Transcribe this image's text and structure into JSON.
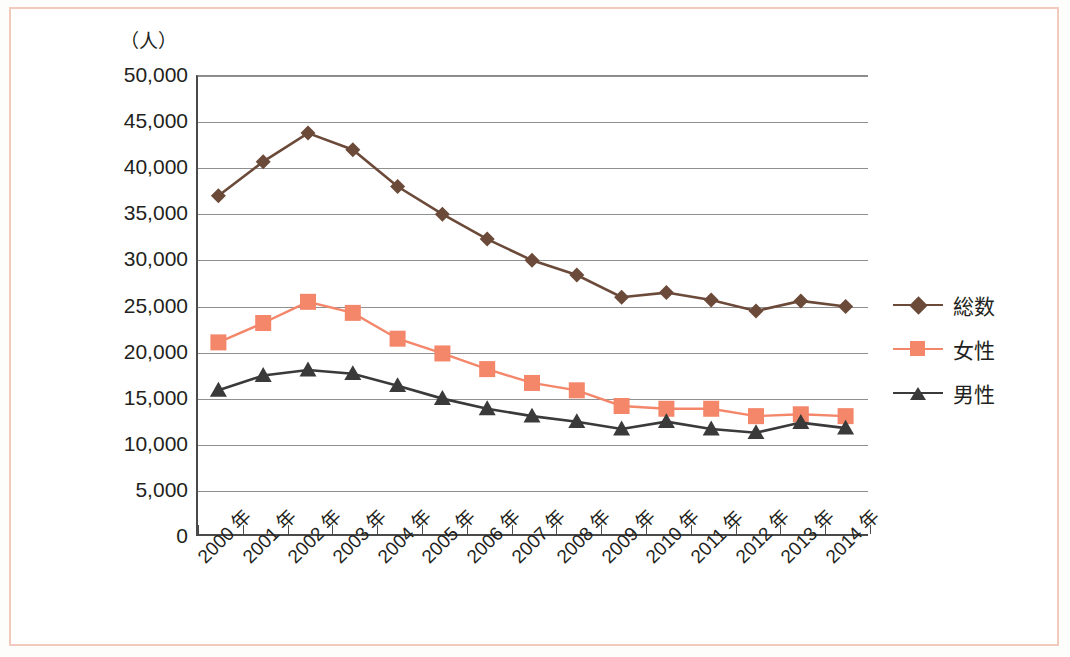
{
  "figure": {
    "unit_label": "（人）",
    "border_color": "#f2c9bd",
    "background": "#ffffff"
  },
  "legend": {
    "position": "right",
    "items": [
      {
        "label": "総数",
        "color": "#6b4a3a",
        "marker": "diamond"
      },
      {
        "label": "女性",
        "color": "#f4866a",
        "marker": "square"
      },
      {
        "label": "男性",
        "color": "#3a3a3a",
        "marker": "triangle"
      }
    ]
  },
  "chart_data": {
    "type": "line",
    "title": "",
    "xlabel": "",
    "ylabel": "（人）",
    "ylim": [
      0,
      50000
    ],
    "ytick_values": [
      0,
      5000,
      10000,
      15000,
      20000,
      25000,
      30000,
      35000,
      40000,
      45000,
      50000
    ],
    "ytick_labels": [
      "0",
      "5,000",
      "10,000",
      "15,000",
      "20,000",
      "25,000",
      "30,000",
      "35,000",
      "40,000",
      "45,000",
      "50,000"
    ],
    "grid": true,
    "categories": [
      "2000 年",
      "2001 年",
      "2002 年",
      "2003 年",
      "2004 年",
      "2005 年",
      "2006 年",
      "2007 年",
      "2008 年",
      "2009 年",
      "2010 年",
      "2011 年",
      "2012 年",
      "2013 年",
      "2014 年"
    ],
    "x": [
      2000,
      2001,
      2002,
      2003,
      2004,
      2005,
      2006,
      2007,
      2008,
      2009,
      2010,
      2011,
      2012,
      2013,
      2014
    ],
    "series": [
      {
        "name": "総数",
        "color": "#6b4a3a",
        "marker": "diamond",
        "values": [
          36900,
          40600,
          43700,
          41900,
          37900,
          34900,
          32200,
          29900,
          28300,
          25900,
          26400,
          25600,
          24400,
          25500,
          24900
        ]
      },
      {
        "name": "女性",
        "color": "#f4866a",
        "marker": "square",
        "values": [
          21000,
          23100,
          25400,
          24200,
          21400,
          19800,
          18100,
          16600,
          15800,
          14100,
          13800,
          13800,
          13000,
          13200,
          13000
        ]
      },
      {
        "name": "男性",
        "color": "#3a3a3a",
        "marker": "triangle",
        "values": [
          15800,
          17400,
          18000,
          17600,
          16300,
          14900,
          13800,
          13000,
          12400,
          11600,
          12400,
          11600,
          11200,
          12300,
          11700
        ]
      }
    ]
  }
}
